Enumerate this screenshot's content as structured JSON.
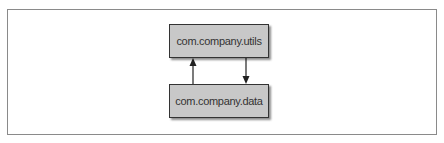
{
  "diagram": {
    "nodes": [
      {
        "id": "utils",
        "label": "com.company.utils"
      },
      {
        "id": "data",
        "label": "com.company.data"
      }
    ],
    "edges": [
      {
        "from": "data",
        "to": "utils",
        "direction": "up"
      },
      {
        "from": "utils",
        "to": "data",
        "direction": "down"
      }
    ],
    "colors": {
      "box_fill": "#c8c8c8",
      "box_border": "#333333",
      "frame_border": "#8a8a8a",
      "arrow": "#222222"
    }
  }
}
